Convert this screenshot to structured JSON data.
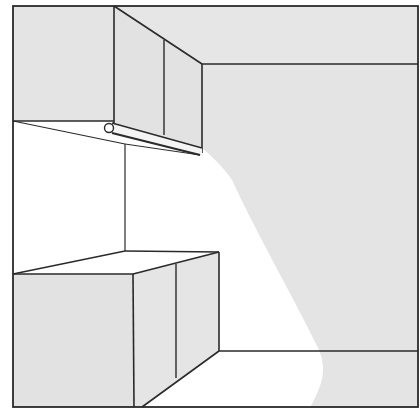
{
  "illustration": {
    "subject": "Kitchen corner with wall cabinets, under-cabinet light fixture and base cabinets",
    "colors": {
      "background": "#ffffff",
      "wall_shade": "#e6e6e6",
      "cabinet_shade": "#e3e3e3",
      "light_beam": "#ffffff",
      "line": "#2a2a2a"
    }
  }
}
